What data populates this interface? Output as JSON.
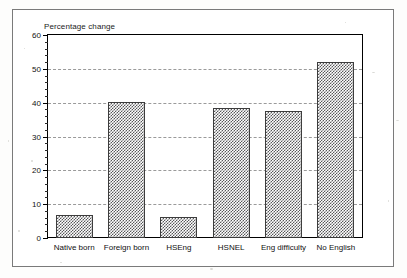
{
  "chart_data": {
    "type": "bar",
    "title": "",
    "subtitle": "",
    "ylabel": "Percentage change",
    "xlabel": "",
    "categories": [
      "Native born",
      "Foreign born",
      "HSEng",
      "HSNEL",
      "Eng difficulty",
      "No English"
    ],
    "values": [
      6.8,
      40.3,
      6.2,
      38.3,
      37.5,
      52.0
    ],
    "ylim": [
      0,
      60
    ],
    "ytick_labels": [
      "0",
      "10",
      "20",
      "30",
      "40",
      "50",
      "60"
    ],
    "ytick_values": [
      0,
      10,
      20,
      30,
      40,
      50,
      60
    ],
    "minor_tick_step": 2,
    "grid": true,
    "grid_axis": "y",
    "legend": false,
    "legend_position": "none",
    "bar_fill": "checkerboard-dither",
    "colors": {
      "bar_fill": "#58585a",
      "bar_edge": "#3d3d3d",
      "gridline": "#9a9a9a",
      "axis": "#000000",
      "text": "#111111",
      "page_border": "#7a7a7a",
      "background": "#ffffff"
    }
  }
}
